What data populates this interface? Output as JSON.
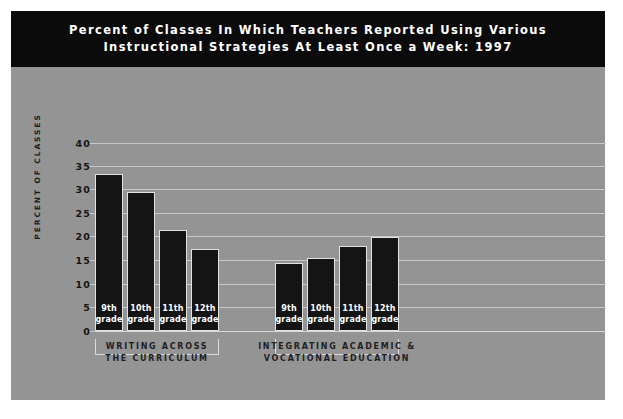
{
  "chart_data": {
    "type": "bar",
    "title": "Percent of Classes In Which Teachers Reported Using Various Instructional Strategies At Least Once a Week: 1997",
    "title_lines": [
      "Percent of Classes In Which Teachers Reported Using Various",
      "Instructional Strategies At Least Once a Week: 1997"
    ],
    "xlabel": "",
    "ylabel": "PERCENT OF CLASSES",
    "ylim": [
      0,
      40
    ],
    "ytick_step": 5,
    "yticks": [
      "40",
      "35",
      "30",
      "25",
      "20",
      "15",
      "10",
      "5",
      "0"
    ],
    "grid": true,
    "legend": "none",
    "categories": [
      "9th grade",
      "10th grade",
      "11th grade",
      "12th grade"
    ],
    "groups": [
      {
        "label_lines": [
          "WRITING ACROSS",
          "THE CURRICULUM"
        ],
        "label": "WRITING ACROSS THE CURRICULUM",
        "values": [
          33.5,
          29.5,
          21.5,
          17.5
        ]
      },
      {
        "label_lines": [
          "INTEGRATING ACADEMIC &",
          "VOCATIONAL EDUCATION"
        ],
        "label": "INTEGRATING ACADEMIC & VOCATIONAL EDUCATION",
        "values": [
          14.5,
          15.5,
          18.0,
          20.0
        ]
      }
    ],
    "bars": [
      {
        "group": 0,
        "category": "9th grade",
        "label_lines": [
          "9th",
          "grade"
        ],
        "value": 33.5
      },
      {
        "group": 0,
        "category": "10th grade",
        "label_lines": [
          "10th",
          "grade"
        ],
        "value": 29.5
      },
      {
        "group": 0,
        "category": "11th grade",
        "label_lines": [
          "11th",
          "grade"
        ],
        "value": 21.5
      },
      {
        "group": 0,
        "category": "12th grade",
        "label_lines": [
          "12th",
          "grade"
        ],
        "value": 17.5
      },
      {
        "group": 1,
        "category": "9th grade",
        "label_lines": [
          "9th",
          "grade"
        ],
        "value": 14.5
      },
      {
        "group": 1,
        "category": "10th grade",
        "label_lines": [
          "10th",
          "grade"
        ],
        "value": 15.5
      },
      {
        "group": 1,
        "category": "11th grade",
        "label_lines": [
          "11th",
          "grade"
        ],
        "value": 18.0
      },
      {
        "group": 1,
        "category": "12th grade",
        "label_lines": [
          "12th",
          "grade"
        ],
        "value": 20.0
      }
    ],
    "colors": {
      "bar": "#141414",
      "plot_background": "#949494",
      "title_background": "#0b0b0b",
      "title_text": "#ffffff",
      "gridline": "#c8c8c8",
      "bar_label_text": "#ffffff",
      "axis_text": "#141414"
    }
  }
}
